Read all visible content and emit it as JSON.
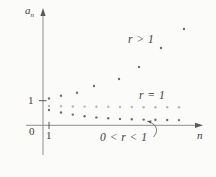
{
  "figure": {
    "labels": {
      "y_axis_base": "a",
      "y_axis_sub": "n",
      "x_axis": "n",
      "origin": "0",
      "x_tick_1": "1",
      "y_tick_1": "1"
    },
    "colors": {
      "background": "#fbfbf9",
      "axis": "#8f8f8f",
      "text": "#3d3d3d",
      "dot_dark": "#6e6e6e",
      "dot_light": "#b6b6b6"
    }
  },
  "chart_data": {
    "type": "scatter",
    "title": "",
    "xlabel": "n",
    "ylabel": "a_n",
    "x_ticks": [
      {
        "value": 1,
        "label": "1"
      }
    ],
    "y_ticks": [
      {
        "value": 1,
        "label": "1"
      }
    ],
    "origin_label": "0",
    "grid": false,
    "legend_position": "inline-annotations",
    "series": [
      {
        "name": "r-greater-than-1",
        "label": "r > 1",
        "color": "#6e6e6e",
        "n": [
          1,
          2,
          3,
          4,
          5,
          6,
          7,
          8
        ],
        "values": [
          1.09,
          1.2,
          1.32,
          1.6,
          1.88,
          2.37,
          3.14,
          3.91
        ],
        "points_px": [
          [
            49,
            98.5
          ],
          [
            61,
            95.8
          ],
          [
            77,
            92.8
          ],
          [
            94,
            86
          ],
          [
            119,
            79
          ],
          [
            139,
            67
          ],
          [
            161,
            48
          ],
          [
            184,
            29
          ]
        ]
      },
      {
        "name": "r-equals-1",
        "label": "r = 1",
        "color": "#b6b6b6",
        "n": [
          1,
          2,
          3,
          4,
          5,
          6,
          7,
          8,
          9,
          10,
          11,
          12
        ],
        "values": [
          1,
          1,
          1,
          1,
          1,
          1,
          1,
          1,
          1,
          1,
          1,
          1
        ],
        "points_px": [
          [
            49,
            106
          ],
          [
            61,
            106.3
          ],
          [
            72.8,
            106.5
          ],
          [
            84.6,
            106.6
          ],
          [
            96.4,
            106.8
          ],
          [
            108.2,
            106.8
          ],
          [
            120,
            107
          ],
          [
            131.8,
            107
          ],
          [
            143.6,
            107.2
          ],
          [
            155.4,
            107.2
          ],
          [
            167.2,
            107.3
          ],
          [
            179,
            107.3
          ]
        ]
      },
      {
        "name": "r-between-0-and-1",
        "label": "0 < r < 1",
        "color": "#6e6e6e",
        "n": [
          1,
          2,
          3,
          4,
          5,
          6,
          7,
          8,
          9,
          10,
          11,
          12
        ],
        "values": [
          0.62,
          0.52,
          0.43,
          0.37,
          0.32,
          0.28,
          0.26,
          0.24,
          0.23,
          0.22,
          0.22,
          0.21
        ],
        "points_px": [
          [
            49,
            110
          ],
          [
            61,
            112.5
          ],
          [
            72.8,
            114.6
          ],
          [
            84.6,
            116.2
          ],
          [
            96.4,
            117.4
          ],
          [
            108.2,
            118.3
          ],
          [
            120,
            118.9
          ],
          [
            131.8,
            119.3
          ],
          [
            143.6,
            119.6
          ],
          [
            155.4,
            119.8
          ],
          [
            167.2,
            120
          ],
          [
            179,
            120.1
          ]
        ]
      }
    ],
    "annotations": [
      {
        "text": "r > 1",
        "target_series": "r-greater-than-1"
      },
      {
        "text": "r = 1",
        "target_series": "r-equals-1"
      },
      {
        "text": "0 < r < 1",
        "target_series": "r-between-0-and-1",
        "arrow": true
      }
    ]
  }
}
